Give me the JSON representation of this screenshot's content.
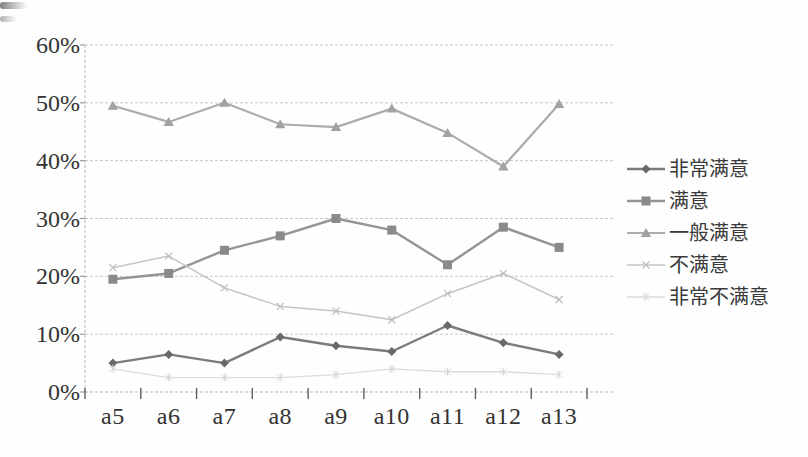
{
  "figure": {
    "background": "#fefefe",
    "title": "",
    "scan_artifact": "corner-smudge"
  },
  "style": {
    "grid_color": "#c6c6c6",
    "axis_color": "#b5b5b5",
    "tick_color": "#5f5f5f",
    "text_color": "#333333",
    "y_label_font_px": 24,
    "x_label_font_px": 24,
    "legend_font_px": 20
  },
  "chart_data": {
    "type": "line",
    "title": "",
    "xlabel": "",
    "ylabel": "",
    "categories": [
      "a5",
      "a6",
      "a7",
      "a8",
      "a9",
      "a10",
      "a11",
      "a12",
      "a13"
    ],
    "series": [
      {
        "name": "非常满意",
        "marker": "diamond",
        "line_color": "#7b7b7b",
        "marker_color": "#696969",
        "line_width": 2.4,
        "values": [
          5,
          6.5,
          5,
          9.5,
          8,
          7,
          11.5,
          8.5,
          6.5
        ]
      },
      {
        "name": "满意",
        "marker": "square",
        "line_color": "#949494",
        "marker_color": "#8a8a8a",
        "line_width": 2.4,
        "values": [
          19.5,
          20.5,
          24.5,
          27,
          30,
          28,
          22,
          28.5,
          25
        ]
      },
      {
        "name": "一般满意",
        "marker": "triangle",
        "line_color": "#acacac",
        "marker_color": "#a2a2a2",
        "line_width": 2.2,
        "values": [
          49.5,
          46.7,
          50,
          46.3,
          45.8,
          49,
          44.8,
          39,
          49.8
        ]
      },
      {
        "name": "不满意",
        "marker": "x",
        "line_color": "#c5c5c5",
        "marker_color": "#bdbdbd",
        "line_width": 1.5,
        "values": [
          21.5,
          23.5,
          18,
          14.8,
          14,
          12.5,
          17,
          20.5,
          16
        ]
      },
      {
        "name": "非常不满意",
        "marker": "star",
        "line_color": "#dbdbdb",
        "marker_color": "#d5d5d5",
        "line_width": 1.3,
        "values": [
          4,
          2.5,
          2.5,
          2.5,
          3,
          4,
          3.5,
          3.5,
          3
        ]
      }
    ],
    "ylim": [
      0,
      60
    ],
    "ytick_step": 10,
    "yticklabels": [
      "0%",
      "10%",
      "20%",
      "30%",
      "40%",
      "50%",
      "60%"
    ],
    "grid": "horizontal-dashed",
    "legend_position": "right"
  }
}
